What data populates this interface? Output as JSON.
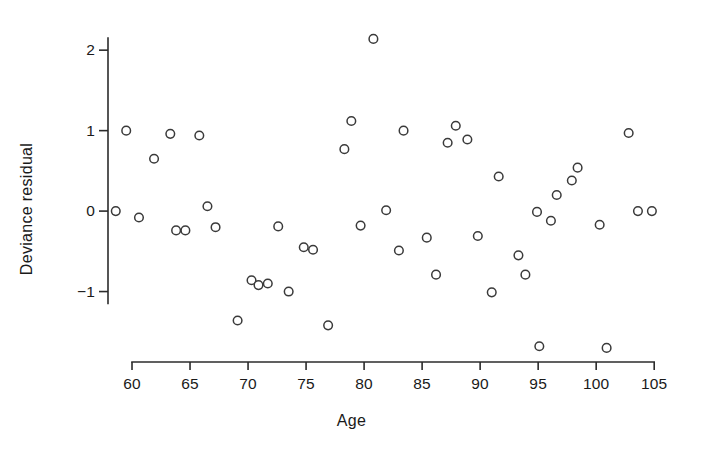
{
  "chart_data": {
    "type": "scatter",
    "title": "",
    "xlabel": "Age",
    "ylabel": "Deviance residual",
    "xlim": [
      57.5,
      105.5
    ],
    "ylim": [
      -1.95,
      2.35
    ],
    "grid": false,
    "legend": null,
    "marker": "open-circle",
    "marker_color": "#3a3a3a",
    "marker_fill": "#ffffff",
    "xticks": [
      60,
      65,
      70,
      75,
      80,
      85,
      90,
      95,
      100,
      105
    ],
    "xtick_labels": [
      "60",
      "65",
      "70",
      "75",
      "80",
      "85",
      "90",
      "95",
      "100",
      "105"
    ],
    "yticks": [
      -1,
      0,
      1,
      2
    ],
    "ytick_labels": [
      "−1",
      "0",
      "1",
      "2"
    ],
    "series": [
      {
        "name": "deviance residuals",
        "points": [
          [
            58.6,
            0.0
          ],
          [
            59.5,
            1.0
          ],
          [
            60.6,
            -0.08
          ],
          [
            61.9,
            0.65
          ],
          [
            63.3,
            0.96
          ],
          [
            63.8,
            -0.24
          ],
          [
            64.6,
            -0.24
          ],
          [
            65.8,
            0.94
          ],
          [
            66.5,
            0.06
          ],
          [
            67.2,
            -0.2
          ],
          [
            69.1,
            -1.36
          ],
          [
            70.3,
            -0.86
          ],
          [
            70.9,
            -0.92
          ],
          [
            71.7,
            -0.9
          ],
          [
            72.6,
            -0.19
          ],
          [
            73.5,
            -1.0
          ],
          [
            74.8,
            -0.45
          ],
          [
            75.6,
            -0.48
          ],
          [
            76.9,
            -1.42
          ],
          [
            78.3,
            0.77
          ],
          [
            78.9,
            1.12
          ],
          [
            79.7,
            -0.18
          ],
          [
            80.8,
            2.14
          ],
          [
            81.9,
            0.01
          ],
          [
            83.4,
            1.0
          ],
          [
            83.0,
            -0.49
          ],
          [
            85.4,
            -0.33
          ],
          [
            86.2,
            -0.79
          ],
          [
            87.2,
            0.85
          ],
          [
            87.9,
            1.06
          ],
          [
            88.9,
            0.89
          ],
          [
            89.8,
            -0.31
          ],
          [
            91.0,
            -1.01
          ],
          [
            91.6,
            0.43
          ],
          [
            93.3,
            -0.55
          ],
          [
            93.9,
            -0.79
          ],
          [
            94.9,
            -0.01
          ],
          [
            95.1,
            -1.68
          ],
          [
            96.1,
            -0.12
          ],
          [
            96.6,
            0.2
          ],
          [
            97.9,
            0.38
          ],
          [
            98.4,
            0.54
          ],
          [
            100.3,
            -0.17
          ],
          [
            100.9,
            -1.7
          ],
          [
            102.8,
            0.97
          ],
          [
            103.6,
            0.0
          ],
          [
            104.8,
            0.0
          ]
        ]
      }
    ]
  },
  "axes": {
    "x_title": "Age",
    "y_title": "Deviance residual"
  }
}
